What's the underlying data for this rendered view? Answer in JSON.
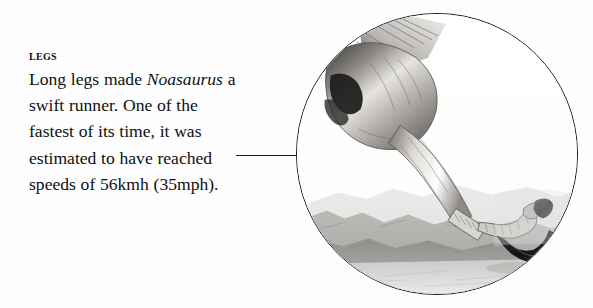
{
  "page": {
    "background_color": "#fefefe",
    "width": 593,
    "height": 308
  },
  "caption": {
    "heading": "Legs",
    "body_runs": [
      {
        "text": "Long legs made ",
        "style": "normal"
      },
      {
        "text": "Noasaurus",
        "style": "italic"
      },
      {
        "text": " a swift runner. One of the fastest of its time, it was estimated to have reached speeds of 56kmh (35mph).",
        "style": "normal"
      }
    ],
    "body_plain": "Long legs made Noasaurus a swift runner. One of the fastest of its time, it was estimated to have reached speeds of 56kmh (35mph).",
    "text_color": "#101010"
  },
  "leader_line": {
    "color": "#1b1b22",
    "orientation": "horizontal"
  },
  "illustration": {
    "name": "noasaurus-leg-illustration",
    "shape": "circle",
    "border_color": "#14141a",
    "description": "Pencil-style drawing of a theropod dinosaur hind leg with clawed foot above a hazy mountain landscape",
    "palette": {
      "outline": "#2a2a2e",
      "limb_light": "#e9e7e4",
      "limb_mid": "#a9a6a2",
      "limb_dark": "#5d5a57",
      "marking_dark": "#1e1d1c",
      "claw": "#17161a",
      "landscape_far": "#cfcfcd",
      "landscape_mid": "#9e9e9c",
      "landscape_near": "#7d7d7b",
      "sky": "#fbfbfa"
    }
  }
}
